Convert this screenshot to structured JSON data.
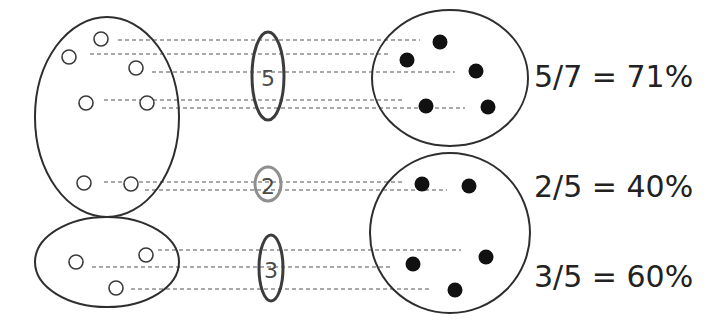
{
  "diagram": {
    "colors": {
      "outline": "#2e2e2e",
      "dash": "#555555",
      "count_dark": "#3c3c3c",
      "count_light": "#8f8f8f",
      "filled_dot": "#111111"
    },
    "left_sets": [
      {
        "name": "left-set-top",
        "open_dots": 7
      },
      {
        "name": "left-set-bottom",
        "open_dots": 3
      }
    ],
    "right_sets": [
      {
        "name": "right-set-top",
        "filled_dots": 5
      },
      {
        "name": "right-set-bottom",
        "filled_dots": 5
      }
    ],
    "counts": [
      {
        "label": "5",
        "tone": "dark"
      },
      {
        "label": "2",
        "tone": "light"
      },
      {
        "label": "3",
        "tone": "dark"
      }
    ],
    "ratios": [
      {
        "text": "5/7 = 71%"
      },
      {
        "text": "2/5 = 40%"
      },
      {
        "text": "3/5 = 60%"
      }
    ]
  }
}
